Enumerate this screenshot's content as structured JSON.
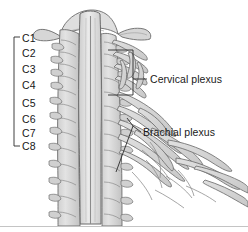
{
  "figure": {
    "background_color": "#ffffff",
    "line_color": "#555555",
    "fill_color": "#d9d9d9",
    "text_color": "#1a1a1a",
    "bottom_border_color": "#bdbdbd"
  },
  "segment_bracket": {
    "name": "cervical-segments-bracket",
    "labels": [
      {
        "id": "c1",
        "text": "C1",
        "x": 22,
        "y": 38
      },
      {
        "id": "c2",
        "text": "C2",
        "x": 22,
        "y": 53
      },
      {
        "id": "c3",
        "text": "C3",
        "x": 22,
        "y": 69
      },
      {
        "id": "c4",
        "text": "C4",
        "x": 22,
        "y": 85
      },
      {
        "id": "c5",
        "text": "C5",
        "x": 22,
        "y": 103
      },
      {
        "id": "c6",
        "text": "C6",
        "x": 22,
        "y": 119
      },
      {
        "id": "c7",
        "text": "C7",
        "x": 22,
        "y": 133
      },
      {
        "id": "c8",
        "text": "C8",
        "x": 22,
        "y": 146
      }
    ]
  },
  "callouts": [
    {
      "id": "cervical-plexus",
      "text": "Cervical plexus",
      "label_x": 150,
      "label_y": 79
    },
    {
      "id": "brachial-plexus",
      "text": "Brachial plexus",
      "label_x": 143,
      "label_y": 132
    }
  ]
}
